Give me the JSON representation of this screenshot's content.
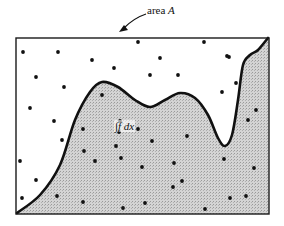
{
  "figure": {
    "title_label": "area",
    "title_var": "A",
    "integral_label": "∫f dx",
    "colors": {
      "frame": "#1a1a1a",
      "curve": "#111111",
      "shaded_region": "#c9c9c9",
      "dots": "#111111",
      "background": "#ffffff"
    },
    "frame": {
      "x": 16,
      "y": 38,
      "width": 253,
      "height": 176
    },
    "curve_points": [
      [
        17,
        213
      ],
      [
        40,
        195
      ],
      [
        60,
        165
      ],
      [
        75,
        120
      ],
      [
        90,
        92
      ],
      [
        102,
        82
      ],
      [
        118,
        87
      ],
      [
        135,
        100
      ],
      [
        150,
        107
      ],
      [
        165,
        100
      ],
      [
        180,
        93
      ],
      [
        195,
        98
      ],
      [
        208,
        115
      ],
      [
        218,
        138
      ],
      [
        225,
        146
      ],
      [
        232,
        135
      ],
      [
        238,
        100
      ],
      [
        243,
        65
      ],
      [
        250,
        55
      ],
      [
        258,
        50
      ],
      [
        268,
        38
      ]
    ],
    "dots_above": [
      [
        23,
        52
      ],
      [
        58,
        52
      ],
      [
        92,
        60
      ],
      [
        138,
        42
      ],
      [
        204,
        42
      ],
      [
        36,
        77
      ],
      [
        114,
        68
      ],
      [
        160,
        58
      ],
      [
        229,
        57
      ],
      [
        64,
        87
      ],
      [
        150,
        75
      ],
      [
        178,
        75
      ],
      [
        227,
        56
      ],
      [
        30,
        108
      ],
      [
        54,
        121
      ],
      [
        62,
        140
      ],
      [
        20,
        161
      ],
      [
        36,
        180
      ],
      [
        22,
        198
      ],
      [
        236,
        83
      ],
      [
        222,
        92
      ]
    ],
    "dots_below": [
      [
        102,
        95
      ],
      [
        120,
        121
      ],
      [
        83,
        129
      ],
      [
        84,
        151
      ],
      [
        95,
        161
      ],
      [
        119,
        132
      ],
      [
        138,
        129
      ],
      [
        116,
        146
      ],
      [
        121,
        158
      ],
      [
        142,
        167
      ],
      [
        174,
        163
      ],
      [
        57,
        196
      ],
      [
        83,
        202
      ],
      [
        123,
        208
      ],
      [
        145,
        203
      ],
      [
        165,
        215
      ],
      [
        182,
        181
      ],
      [
        173,
        187
      ],
      [
        187,
        136
      ],
      [
        152,
        141
      ],
      [
        248,
        120
      ],
      [
        256,
        110
      ],
      [
        254,
        168
      ],
      [
        246,
        196
      ],
      [
        230,
        198
      ],
      [
        224,
        159
      ],
      [
        205,
        209
      ],
      [
        263,
        221
      ]
    ]
  }
}
